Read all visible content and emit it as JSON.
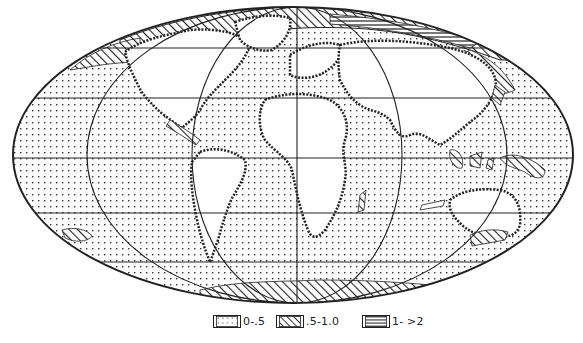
{
  "map": {
    "projection": "Mollweide world map",
    "colors": {
      "ink": "#222222",
      "background": "#ffffff",
      "land": "#ffffff"
    },
    "parallels_y": [
      48,
      98,
      158,
      213,
      262
    ],
    "meridians": [
      "-120",
      "-60",
      "0",
      "60",
      "120"
    ]
  },
  "legend": {
    "items": [
      {
        "pattern": "dots",
        "label": "0-.5"
      },
      {
        "pattern": "diagonal-hatch",
        "label": ".5-1.0"
      },
      {
        "pattern": "horizontal-hatch",
        "label": "1- >2"
      }
    ]
  }
}
